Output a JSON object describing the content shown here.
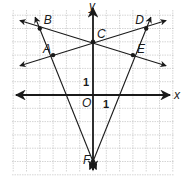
{
  "diagram": {
    "type": "coordinate-plane",
    "axes": {
      "x_label": "x",
      "y_label": "y",
      "origin_label": "O",
      "x_tick_label": "1",
      "y_tick_label": "1"
    },
    "grid": {
      "x_range": [
        -6,
        6
      ],
      "y_range": [
        -6,
        6
      ],
      "visible": true
    },
    "points": [
      {
        "name": "A",
        "x": -3,
        "y": 3
      },
      {
        "name": "B",
        "x": -4,
        "y": 5
      },
      {
        "name": "C",
        "x": 0,
        "y": 4
      },
      {
        "name": "D",
        "x": 4,
        "y": 5
      },
      {
        "name": "E",
        "x": 3,
        "y": 3
      },
      {
        "name": "F",
        "x": 0,
        "y": -5
      }
    ],
    "lines": [
      {
        "name": "line-AC",
        "through": [
          "A",
          "C",
          "D"
        ]
      },
      {
        "name": "line-BC",
        "through": [
          "B",
          "C",
          "E"
        ]
      },
      {
        "name": "line-FB",
        "through": [
          "F",
          "A",
          "B"
        ]
      },
      {
        "name": "line-FD",
        "through": [
          "F",
          "E",
          "D"
        ]
      }
    ],
    "colors": {
      "grid": "#b8b8b8",
      "ink": "#1a1a1a"
    }
  }
}
